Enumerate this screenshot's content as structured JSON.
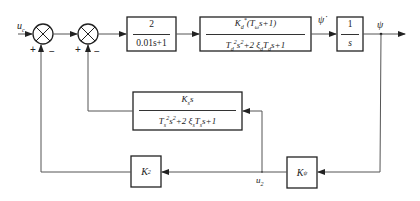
{
  "diagram": {
    "type": "control-block-diagram",
    "input_signal": "u",
    "input_subscript": "c",
    "sum1": {
      "signs": [
        "+",
        "−"
      ]
    },
    "sum2": {
      "signs": [
        "+",
        "−"
      ]
    },
    "block_actuator": {
      "numerator": "2",
      "denominator": "0.01s+1"
    },
    "block_plant": {
      "numerator": {
        "gain": "K",
        "gain_sub": "d",
        "gain_sup": "*",
        "rest": "(T",
        "tsub": "ω",
        "tail": "s+1)"
      },
      "denominator": {
        "t1": "T",
        "t1sub": "d",
        "t1sup": "2",
        "s2": "s",
        "s2sup": "2",
        "mid": "+2 ξ",
        "xisub": "d",
        "t2": "T",
        "t2sub": "d",
        "end": "s+1"
      }
    },
    "psi_dot_label": "ψ̇",
    "block_integrator": {
      "numerator": "1",
      "denominator": "s"
    },
    "output_signal": "ψ",
    "block_rate_sensor": {
      "numerator": {
        "gain": "K",
        "gain_sub": "s",
        "tail": "s"
      },
      "denominator": {
        "t1": "T",
        "t1sub": "s",
        "t1sup": "2",
        "s2": "s",
        "s2sup": "2",
        "mid": "+2 ξ",
        "xisub": "s",
        "t2": "T",
        "t2sub": "s",
        "end": "s+1"
      }
    },
    "block_k2": {
      "gain": "K",
      "sub": "2"
    },
    "block_kpsi": {
      "gain": "K",
      "sub": "ψ"
    },
    "node_u2": {
      "label": "u",
      "sub": "2"
    }
  }
}
